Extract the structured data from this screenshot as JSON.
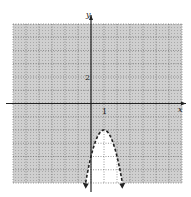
{
  "chart_data": {
    "type": "line",
    "title": "",
    "xlabel": "x",
    "ylabel": "y",
    "xlim": [
      -6,
      7
    ],
    "ylim": [
      -6,
      6
    ],
    "grid": true,
    "grid_step": 1,
    "tick_labels": [
      {
        "axis": "y",
        "value": 2,
        "text": "2"
      },
      {
        "axis": "x",
        "value": 1,
        "text": "1"
      }
    ],
    "series": [
      {
        "name": "boundary",
        "equation": "y = -2(x - 1)^2 - 2",
        "style": "dashed",
        "vertex": [
          1,
          -2
        ],
        "x_range": [
          -0.41,
          2.41
        ],
        "arrows_at_ends": true
      }
    ],
    "shaded_region": "outside the parabola (y > -2(x-1)^2 - 2)",
    "unshaded_region": "inside the parabola"
  },
  "colors": {
    "shade": "#c8c8c8",
    "grid": "#6e6e6e",
    "axis": "#222222",
    "curve": "#222222",
    "background": "#ffffff"
  }
}
